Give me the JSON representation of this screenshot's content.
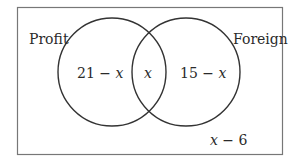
{
  "diagram": {
    "type": "venn",
    "sets": [
      {
        "name": "Profit",
        "only_region": "21 − x"
      },
      {
        "name": "Foreign",
        "only_region": "15 − x"
      }
    ],
    "intersection": "x",
    "outside": "x − 6",
    "colors": {
      "stroke": "#333333",
      "frame": "#777777",
      "text": "#2a2a2a"
    }
  },
  "labels": {
    "profit": "Profit",
    "foreign": "Foreign",
    "profit_only": "21 − ",
    "profit_only_var": "x",
    "intersection": "x",
    "foreign_only": "15 − ",
    "foreign_only_var": "x",
    "outside_var": "x",
    "outside_rest": " − 6"
  }
}
